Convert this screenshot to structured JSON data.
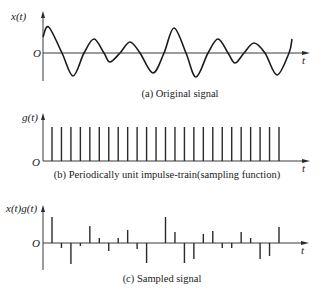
{
  "panels": [
    {
      "id": "a",
      "y_label": "x(t)",
      "origin_label": "O",
      "x_label": "t",
      "caption": "(a) Original signal",
      "type": "continuous",
      "curve_points": [
        [
          43,
          37
        ],
        [
          48.7,
          27
        ],
        [
          62,
          53
        ],
        [
          73,
          76
        ],
        [
          84,
          53
        ],
        [
          94,
          39
        ],
        [
          104,
          53
        ],
        [
          110,
          62
        ],
        [
          120,
          53
        ],
        [
          130,
          42
        ],
        [
          140,
          53
        ],
        [
          153,
          73
        ],
        [
          164,
          53
        ],
        [
          174,
          28
        ],
        [
          186,
          53
        ],
        [
          196,
          77
        ],
        [
          208,
          53
        ],
        [
          218,
          39
        ],
        [
          228,
          53
        ],
        [
          235,
          63
        ],
        [
          244,
          53
        ],
        [
          254,
          43
        ],
        [
          265,
          53
        ],
        [
          277,
          75
        ],
        [
          289,
          53
        ],
        [
          292,
          39
        ]
      ]
    },
    {
      "id": "b",
      "y_label": "g(t)",
      "origin_label": "O",
      "x_label": "t",
      "caption": "(b) Periodically unit impulse-train(sampling function)",
      "type": "impulse_train",
      "impulse_count": 25,
      "impulse_height": 1
    },
    {
      "id": "c",
      "y_label": "x(t)g(t)",
      "origin_label": "O",
      "x_label": "t",
      "caption": "(c) Sampled signal",
      "type": "sampled",
      "sample_values": [
        26,
        -5,
        -21,
        -3,
        17,
        5,
        -8,
        5,
        13,
        -6,
        -20,
        0,
        26,
        11,
        -20,
        -16,
        9,
        12,
        -5,
        -5,
        11,
        5,
        -16,
        -13,
        16
      ]
    }
  ]
}
